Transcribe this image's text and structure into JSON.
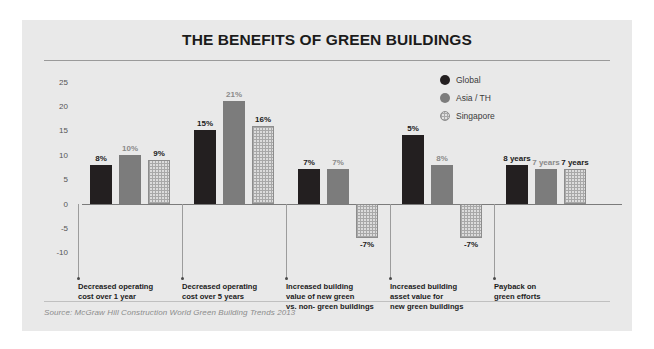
{
  "card": {
    "title": "THE BENEFITS OF GREEN BUILDINGS",
    "source": "Source: McGraw Hill Construction World Green Building Trends 2013"
  },
  "legend": {
    "items": [
      {
        "label": "Global",
        "color": "#231f20",
        "key": "global"
      },
      {
        "label": "Asia / TH",
        "color": "#7c7c7c",
        "key": "asia"
      },
      {
        "label": "Singapore",
        "color": "#dcdcdc",
        "key": "singapore"
      }
    ]
  },
  "chart_data": {
    "type": "bar",
    "title": "THE BENEFITS OF GREEN BUILDINGS",
    "xlabel": "",
    "ylabel": "",
    "ylim": [
      -12,
      27
    ],
    "grid": false,
    "legend_position": "top-right",
    "yticks": [
      "25",
      "20",
      "15",
      "10",
      "5",
      "0",
      "-5",
      "-10"
    ],
    "ytick_values": [
      25,
      20,
      15,
      10,
      5,
      0,
      -5,
      -10
    ],
    "categories": [
      "Decreased operating cost over 1 year",
      "Decreased operating cost over 5 years",
      "Increased building value of new green vs. non- green buildings",
      "Increased building asset value for new green buildings",
      "Payback on green efforts"
    ],
    "category_lines": [
      [
        "Decreased operating",
        "cost over 1 year"
      ],
      [
        "Decreased operating",
        "cost over 5 years"
      ],
      [
        "Increased building",
        "value of new green",
        "vs. non- green buildings"
      ],
      [
        "Increased building",
        "asset value for",
        "new green buildings"
      ],
      [
        "Payback on",
        "green efforts"
      ]
    ],
    "series": [
      {
        "name": "Global",
        "color": "#231f20",
        "values": [
          8,
          15,
          7,
          14,
          8
        ],
        "labels": [
          "8%",
          "15%",
          "7%",
          "5%",
          "8 years"
        ]
      },
      {
        "name": "Asia / TH",
        "color": "#7c7c7c",
        "values": [
          10,
          21,
          7,
          8,
          7
        ],
        "labels": [
          "10%",
          "21%",
          "7%",
          "8%",
          "7 years"
        ]
      },
      {
        "name": "Singapore",
        "color": "#dcdcdc",
        "values": [
          9,
          16,
          -7,
          -7,
          7
        ],
        "labels": [
          "9%",
          "16%",
          "-7%",
          "-7%",
          "7 years"
        ]
      }
    ]
  }
}
